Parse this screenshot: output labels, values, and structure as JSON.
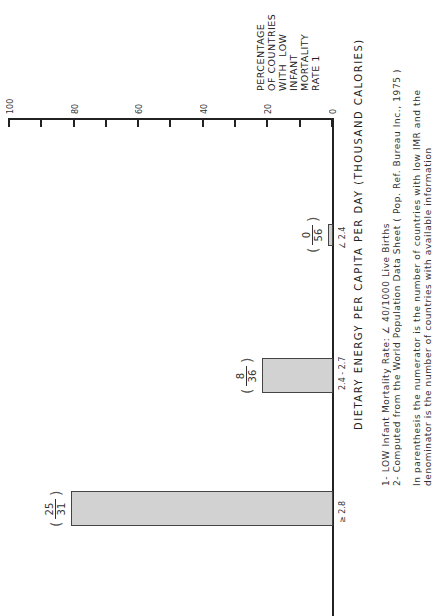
{
  "chart_data": {
    "type": "bar",
    "orientation": "vertical bars, whole figure rotated 90 degrees",
    "title": "",
    "xlabel": "DIETARY ENERGY PER CAPITA PER DAY (THOUSAND CALORIES)",
    "ylabel": "PERCENTAGE OF COUNTRIES WITH LOW INFANT MORTALITY RATE 1",
    "ylim": [
      0,
      100
    ],
    "yticks": [
      "0",
      "20",
      "40",
      "60",
      "80",
      "100"
    ],
    "categories": [
      "∠ 2.4",
      "2.4 - 2.7",
      "≥ 2.8"
    ],
    "values": [
      0,
      22,
      81
    ],
    "fractions": [
      {
        "numerator": "0",
        "denominator": "56"
      },
      {
        "numerator": "8",
        "denominator": "36"
      },
      {
        "numerator": "25",
        "denominator": "31"
      }
    ],
    "grid": false,
    "legend": null,
    "notes": [
      "1- LOW Infant Mortality Rate: ∠ 40/1000 Live Births",
      "2- Computed from the World Population Data Sheet ( Pop. Ref. Bureau Inc., 1975 )",
      "In parenthesis the numerator is the number of countries with low IMR and the",
      "denominator is the number of countries with available information"
    ]
  },
  "axis": {
    "ylabel_lines": [
      "PERCENTAGE",
      "OF COUNTRIES",
      "WITH  LOW",
      "INFANT",
      "MORTALITY",
      "RATE 1"
    ],
    "tick_labels": [
      "100",
      "80",
      "60",
      "40",
      "20",
      "0"
    ]
  }
}
